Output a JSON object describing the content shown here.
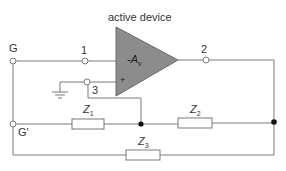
{
  "title": "active device",
  "amplifier": {
    "gain_prefix": "-A",
    "gain_sub": "v",
    "plus_sign": "+",
    "fill": "#8c8c8c"
  },
  "terminals": {
    "g": "G",
    "g_prime": "G'",
    "t1": "1",
    "t2": "2",
    "t3": "3"
  },
  "impedances": {
    "z1": {
      "main": "Z",
      "sub": "1"
    },
    "z2": {
      "main": "Z",
      "sub": "2"
    },
    "z3": {
      "main": "Z",
      "sub": "3"
    }
  },
  "colors": {
    "wire": "#7a7a7a",
    "dot": "#111111",
    "text": "#333333"
  }
}
